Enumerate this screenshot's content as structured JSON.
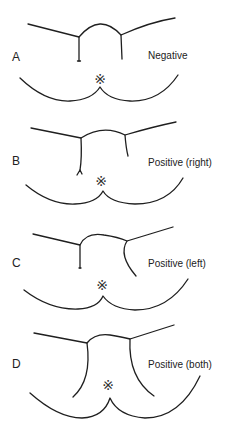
{
  "figure": {
    "stroke_color": "#1f1f1f",
    "text_color": "#222222",
    "asterisk_symbol": "※",
    "panels": [
      {
        "letter": "A",
        "result": "Negative"
      },
      {
        "letter": "B",
        "result": "Positive (right)"
      },
      {
        "letter": "C",
        "result": "Positive (left)"
      },
      {
        "letter": "D",
        "result": "Positive (both)"
      }
    ]
  }
}
